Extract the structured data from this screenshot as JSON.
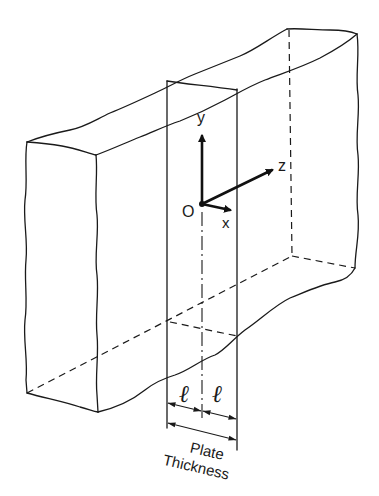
{
  "figure": {
    "axes": {
      "origin_label": "O",
      "x_label": "x",
      "y_label": "y",
      "z_label": "z"
    },
    "dimensions": {
      "half_thickness_left": "ℓ",
      "half_thickness_right": "ℓ",
      "total_label_line1": "Plate",
      "total_label_line2": "Thickness"
    },
    "colors": {
      "line": "#1a1a1a",
      "background": "#ffffff"
    }
  }
}
